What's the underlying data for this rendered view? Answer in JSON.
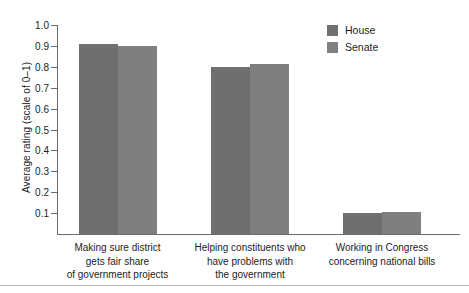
{
  "chart_data": {
    "type": "bar",
    "title": "",
    "xlabel": "",
    "ylabel": "Average rating (scale of 0–1)",
    "ylim": [
      0,
      1.0
    ],
    "grid": false,
    "legend_position": "top-right",
    "categories": [
      "Making sure district\ngets fair share\nof government projects",
      "Helping constituents who\nhave problems with\nthe government",
      "Working in Congress\nconcerning national bills"
    ],
    "category_lines": [
      [
        "Making sure district",
        "gets fair share",
        "of government projects"
      ],
      [
        "Helping constituents who",
        "have problems with",
        "the government"
      ],
      [
        "Working in Congress",
        "concerning national bills"
      ]
    ],
    "series": [
      {
        "name": "House",
        "color": "#6f6f6f",
        "values": [
          0.91,
          0.8,
          0.1
        ]
      },
      {
        "name": "Senate",
        "color": "#7f7f7f",
        "values": [
          0.9,
          0.815,
          0.105
        ]
      }
    ],
    "ytick_labels": [
      "1.0",
      "0.9",
      "0.8",
      "0.7",
      "0.6",
      "0.5",
      "0.4",
      "0.3",
      "0.2",
      "0.1"
    ],
    "ytick_values": [
      1.0,
      0.9,
      0.8,
      0.7,
      0.6,
      0.5,
      0.4,
      0.3,
      0.2,
      0.1
    ]
  },
  "legend": {
    "entries": [
      {
        "label": "House",
        "color": "#6f6f6f"
      },
      {
        "label": "Senate",
        "color": "#7f7f7f"
      }
    ]
  },
  "colors": {
    "axis": "#6c6c6c",
    "text": "#1c1c1c",
    "background": "#ffffff",
    "rule": "#b9b9b9"
  }
}
